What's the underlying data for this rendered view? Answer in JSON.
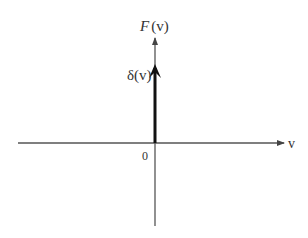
{
  "diagram": {
    "y_axis_label_func": "F",
    "y_axis_label_arg": "(v)",
    "x_axis_label": "v",
    "origin_label": "0",
    "impulse_label": "δ(v)",
    "colors": {
      "axis": "#555555",
      "impulse": "#111111",
      "text": "#333333"
    }
  }
}
